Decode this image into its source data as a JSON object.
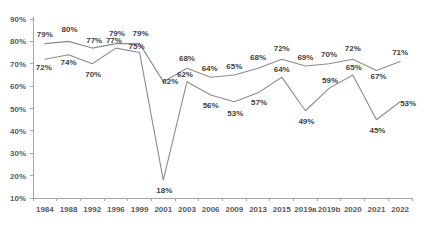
{
  "chart_data": {
    "type": "line",
    "title": "",
    "subtitle": "",
    "xlabel": "",
    "ylabel": "",
    "grid": false,
    "legend_position": "none",
    "ylim": [
      10,
      90
    ],
    "ytick_labels": [
      "90%",
      "80%",
      "70%",
      "60%",
      "50%",
      "40%",
      "30%",
      "20%",
      "10%"
    ],
    "ytick_values": [
      90,
      80,
      70,
      60,
      50,
      40,
      30,
      20,
      10
    ],
    "categories": [
      "1984",
      "1988",
      "1992",
      "1996",
      "1999",
      "2001",
      "2003",
      "2006",
      "2009",
      "2013",
      "2015",
      "2019a",
      "2019b",
      "2020",
      "2021",
      "2022"
    ],
    "series": [
      {
        "name": "Upper series",
        "color": "#8c8c8c",
        "values": [
          79,
          80,
          77,
          79,
          79,
          62,
          68,
          64,
          65,
          68,
          72,
          69,
          70,
          72,
          67,
          71
        ],
        "labels": [
          "79%",
          "80%",
          "77%",
          "79%",
          "79%",
          "62%",
          "68%",
          "64%",
          "65%",
          "68%",
          "72%",
          "69%",
          "70%",
          "72%",
          "67%",
          "71%"
        ]
      },
      {
        "name": "Lower series",
        "color": "#8c8c8c",
        "values": [
          72,
          74,
          70,
          77,
          75,
          18,
          62,
          56,
          53,
          57,
          64,
          49,
          59,
          65,
          45,
          53
        ],
        "labels": [
          "72%",
          "74%",
          "70%",
          "77%",
          "75%",
          "18%",
          "62%",
          "56%",
          "53%",
          "57%",
          "64%",
          "49%",
          "59%",
          "65%",
          "45%",
          "53%"
        ]
      }
    ],
    "label_offsets": {
      "upper": [
        {
          "dx": 0,
          "dy": -7
        },
        {
          "dx": 1,
          "dy": -9
        },
        {
          "dx": 2,
          "dy": -5
        },
        {
          "dx": 1,
          "dy": -8
        },
        {
          "dx": 1,
          "dy": -8
        },
        {
          "dx": 7,
          "dy": 2
        },
        {
          "dx": 0,
          "dy": -7
        },
        {
          "dx": -1,
          "dy": -6
        },
        {
          "dx": 0,
          "dy": -6
        },
        {
          "dx": 0,
          "dy": -8
        },
        {
          "dx": 0,
          "dy": -8
        },
        {
          "dx": 0,
          "dy": -6
        },
        {
          "dx": 0,
          "dy": -7
        },
        {
          "dx": 0,
          "dy": -8
        },
        {
          "dx": 2,
          "dy": 9
        },
        {
          "dx": 0,
          "dy": -7
        }
      ],
      "lower": [
        {
          "dx": -1,
          "dy": 11
        },
        {
          "dx": 0,
          "dy": 10
        },
        {
          "dx": 1,
          "dy": 13
        },
        {
          "dx": -2,
          "dy": -5
        },
        {
          "dx": -3,
          "dy": -4
        },
        {
          "dx": 1,
          "dy": 13
        },
        {
          "dx": -2,
          "dy": -5
        },
        {
          "dx": 0,
          "dy": 13
        },
        {
          "dx": 1,
          "dy": 14
        },
        {
          "dx": 1,
          "dy": 12
        },
        {
          "dx": 0,
          "dy": -5
        },
        {
          "dx": 1,
          "dy": 13
        },
        {
          "dx": 1,
          "dy": -5
        },
        {
          "dx": 1,
          "dy": -5
        },
        {
          "dx": 1,
          "dy": 13
        },
        {
          "dx": 8,
          "dy": 4
        }
      ]
    }
  }
}
